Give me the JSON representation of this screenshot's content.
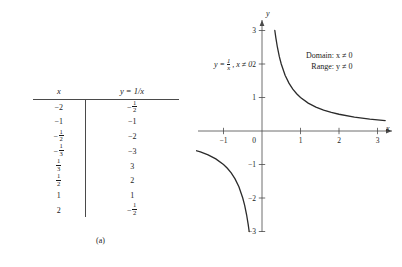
{
  "figure": {
    "panel_a": {
      "caption": "(a)",
      "table": {
        "headers": {
          "x": "x",
          "y": "y = 1/x"
        },
        "rows": [
          {
            "x": "−2",
            "x_type": "int",
            "y": "−1/2",
            "y_type": "frac",
            "y_num": "1",
            "y_den": "2",
            "y_sign": "−"
          },
          {
            "x": "−1",
            "x_type": "int",
            "y": "−1",
            "y_type": "int"
          },
          {
            "x": "−1/2",
            "x_type": "frac",
            "x_num": "1",
            "x_den": "2",
            "x_sign": "−",
            "y": "−2",
            "y_type": "int"
          },
          {
            "x": "−1/3",
            "x_type": "frac",
            "x_num": "1",
            "x_den": "3",
            "x_sign": "−",
            "y": "−3",
            "y_type": "int"
          },
          {
            "x": "1/3",
            "x_type": "frac",
            "x_num": "1",
            "x_den": "3",
            "x_sign": "",
            "y": "3",
            "y_type": "int"
          },
          {
            "x": "1/2",
            "x_type": "frac",
            "x_num": "1",
            "x_den": "2",
            "x_sign": "",
            "y": "2",
            "y_type": "int"
          },
          {
            "x": "1",
            "x_type": "int",
            "y": "1",
            "y_type": "int"
          },
          {
            "x": "2",
            "x_type": "int",
            "y": "−1/2",
            "y_type": "frac",
            "y_num": "1",
            "y_den": "2",
            "y_sign": "−"
          }
        ]
      }
    },
    "panel_b": {
      "caption": "(b)",
      "equation": {
        "lhs": "y",
        "eq": "=",
        "num": "1",
        "den": "x",
        "condition": ", x ≠ 0"
      },
      "annotations": {
        "domain": "Domain:  x ≠ 0",
        "range": "Range:  y ≠ 0"
      },
      "axis_labels": {
        "x": "x",
        "y": "y"
      },
      "origin_label": "0"
    }
  },
  "chart_data": {
    "type": "line",
    "title": "",
    "xlabel": "x",
    "ylabel": "y",
    "function": "y = 1/x",
    "domain_note": "x ≠ 0",
    "range_note": "y ≠ 0",
    "xlim": [
      -3.4,
      3.5
    ],
    "ylim": [
      -3.3,
      3.4
    ],
    "grid": false,
    "legend": null,
    "xticks": [
      -3,
      -2,
      -1,
      0,
      1,
      2,
      3
    ],
    "xtick_labels": [
      "",
      "−2",
      "−1",
      "0",
      "1",
      "2",
      "3"
    ],
    "yticks": [
      -3,
      -2,
      -1,
      1,
      2,
      3
    ],
    "ytick_labels": [
      "−3",
      "−2",
      "−1",
      "1",
      "2",
      "3"
    ],
    "series": [
      {
        "name": "y = 1/x (x > 0)",
        "color": "#2b2b2b",
        "points": [
          [
            0.333,
            3.0
          ],
          [
            0.36,
            2.78
          ],
          [
            0.4,
            2.5
          ],
          [
            0.45,
            2.22
          ],
          [
            0.5,
            2.0
          ],
          [
            0.6,
            1.667
          ],
          [
            0.7,
            1.429
          ],
          [
            0.8,
            1.25
          ],
          [
            0.9,
            1.111
          ],
          [
            1.0,
            1.0
          ],
          [
            1.2,
            0.833
          ],
          [
            1.4,
            0.714
          ],
          [
            1.6,
            0.625
          ],
          [
            1.8,
            0.556
          ],
          [
            2.0,
            0.5
          ],
          [
            2.4,
            0.417
          ],
          [
            2.8,
            0.357
          ],
          [
            3.2,
            0.3125
          ]
        ]
      },
      {
        "name": "y = 1/x (x < 0)",
        "color": "#2b2b2b",
        "points": [
          [
            -3.2,
            -0.3125
          ],
          [
            -2.8,
            -0.357
          ],
          [
            -2.4,
            -0.417
          ],
          [
            -2.0,
            -0.5
          ],
          [
            -1.8,
            -0.556
          ],
          [
            -1.6,
            -0.625
          ],
          [
            -1.4,
            -0.714
          ],
          [
            -1.2,
            -0.833
          ],
          [
            -1.0,
            -1.0
          ],
          [
            -0.9,
            -1.111
          ],
          [
            -0.8,
            -1.25
          ],
          [
            -0.7,
            -1.429
          ],
          [
            -0.6,
            -1.667
          ],
          [
            -0.5,
            -2.0
          ],
          [
            -0.45,
            -2.22
          ],
          [
            -0.4,
            -2.5
          ],
          [
            -0.36,
            -2.78
          ],
          [
            -0.333,
            -3.0
          ]
        ]
      }
    ],
    "table": {
      "columns": [
        "x",
        "y = 1/x"
      ],
      "rows": [
        [
          "-2",
          "-1/2"
        ],
        [
          "-1",
          "-1"
        ],
        [
          "-1/2",
          "-2"
        ],
        [
          "-1/3",
          "-3"
        ],
        [
          "1/3",
          "3"
        ],
        [
          "1/2",
          "2"
        ],
        [
          "1",
          "1"
        ],
        [
          "2",
          "-1/2"
        ]
      ]
    }
  }
}
